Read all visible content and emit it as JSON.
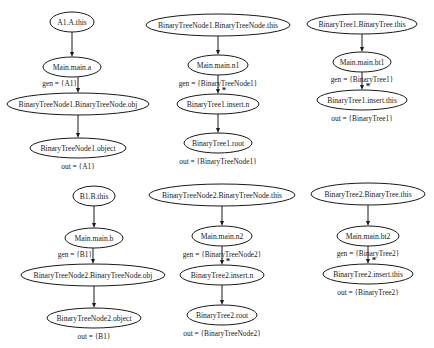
{
  "colors": {
    "stroke": "#1a1a1a",
    "background": "#ffffff"
  },
  "graphs": [
    {
      "id": "A1",
      "nodes": [
        {
          "label": "A1.A.this",
          "cx": 72,
          "cy": 22,
          "rx": 22,
          "ry": 10
        },
        {
          "label": "Main.main.a",
          "cx": 72,
          "cy": 67,
          "rx": 29,
          "ry": 10
        },
        {
          "label": "BinaryTreeNode1.BinaryTreeNode.obj",
          "cx": 78,
          "cy": 104,
          "rx": 71,
          "ry": 11
        },
        {
          "label": "BinaryTreeNode1.object",
          "cx": 78,
          "cy": 148,
          "rx": 48,
          "ry": 10
        }
      ],
      "edges": [
        {
          "from": 0,
          "to": 1,
          "label": "",
          "star": false
        },
        {
          "from": 1,
          "to": 2,
          "label": "gen = {A1}",
          "star": false
        },
        {
          "from": 2,
          "to": 3,
          "label": "",
          "star": false
        }
      ],
      "out_label": "out = {A1}"
    },
    {
      "id": "BTN1",
      "nodes": [
        {
          "label": "BinaryTreeNode1.BinaryTreeNode.this",
          "cx": 218,
          "cy": 25,
          "rx": 72,
          "ry": 11
        },
        {
          "label": "Main.main.n1",
          "cx": 218,
          "cy": 65,
          "rx": 30,
          "ry": 10
        },
        {
          "label": "BinaryTree1.insert.n",
          "cx": 218,
          "cy": 104,
          "rx": 41,
          "ry": 10
        },
        {
          "label": "BinaryTree1.root",
          "cx": 218,
          "cy": 143,
          "rx": 34,
          "ry": 10
        }
      ],
      "edges": [
        {
          "from": 0,
          "to": 1,
          "label": "",
          "star": false
        },
        {
          "from": 1,
          "to": 2,
          "label": "gen = {BinaryTreeNode1}",
          "star": true
        },
        {
          "from": 2,
          "to": 3,
          "label": "",
          "star": false
        }
      ],
      "out_label": "out = {BinaryTreeNode1}"
    },
    {
      "id": "BT1",
      "nodes": [
        {
          "label": "BinaryTree1.BinaryTree.this",
          "cx": 362,
          "cy": 24,
          "rx": 55,
          "ry": 10
        },
        {
          "label": "Main.main.bt1",
          "cx": 362,
          "cy": 62,
          "rx": 29,
          "ry": 10
        },
        {
          "label": "BinaryTree1.insert.this",
          "cx": 362,
          "cy": 100,
          "rx": 45,
          "ry": 10
        }
      ],
      "edges": [
        {
          "from": 0,
          "to": 1,
          "label": "",
          "star": false
        },
        {
          "from": 1,
          "to": 2,
          "label": "gen = {BinaryTree1}",
          "star": true
        }
      ],
      "out_label": "out = {BinaryTree1}"
    },
    {
      "id": "B1",
      "nodes": [
        {
          "label": "B1.B.this",
          "cx": 94,
          "cy": 196,
          "rx": 21,
          "ry": 10
        },
        {
          "label": "Main.main.b",
          "cx": 94,
          "cy": 238,
          "rx": 29,
          "ry": 10
        },
        {
          "label": "BinaryTreeNode2.BinaryTreeNode.obj",
          "cx": 93,
          "cy": 275,
          "rx": 72,
          "ry": 11
        },
        {
          "label": "BinaryTreeNode2.object",
          "cx": 94,
          "cy": 318,
          "rx": 47,
          "ry": 10
        }
      ],
      "edges": [
        {
          "from": 0,
          "to": 1,
          "label": "",
          "star": false
        },
        {
          "from": 1,
          "to": 2,
          "label": "gen = {B1}",
          "star": false
        },
        {
          "from": 2,
          "to": 3,
          "label": "",
          "star": false
        }
      ],
      "out_label": "out = {B1}"
    },
    {
      "id": "BTN2",
      "nodes": [
        {
          "label": "BinaryTreeNode2.BinaryTreeNode.this",
          "cx": 222,
          "cy": 195,
          "rx": 73,
          "ry": 11
        },
        {
          "label": "Main.main.n2",
          "cx": 222,
          "cy": 236,
          "rx": 30,
          "ry": 10
        },
        {
          "label": "BinaryTree2.insert.n",
          "cx": 222,
          "cy": 275,
          "rx": 42,
          "ry": 10
        },
        {
          "label": "BinaryTree2.root",
          "cx": 222,
          "cy": 315,
          "rx": 35,
          "ry": 10
        }
      ],
      "edges": [
        {
          "from": 0,
          "to": 1,
          "label": "",
          "star": false
        },
        {
          "from": 1,
          "to": 2,
          "label": "gen = {BinaryTreeNode2}",
          "star": true
        },
        {
          "from": 2,
          "to": 3,
          "label": "",
          "star": false
        }
      ],
      "out_label": "out = {BinaryTreeNode2}"
    },
    {
      "id": "BT2",
      "nodes": [
        {
          "label": "BinaryTree2.BinaryTree.this",
          "cx": 368,
          "cy": 194,
          "rx": 57,
          "ry": 11
        },
        {
          "label": "Main.main.bt2",
          "cx": 368,
          "cy": 236,
          "rx": 31,
          "ry": 10
        },
        {
          "label": "BinaryTree2.insert.this",
          "cx": 368,
          "cy": 274,
          "rx": 45,
          "ry": 10
        }
      ],
      "edges": [
        {
          "from": 0,
          "to": 1,
          "label": "",
          "star": false
        },
        {
          "from": 1,
          "to": 2,
          "label": "gen = {BinaryTree2}",
          "star": true
        }
      ],
      "out_label": "out = {BinaryTree2}"
    }
  ]
}
